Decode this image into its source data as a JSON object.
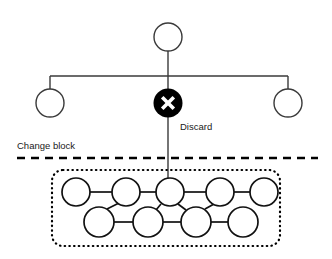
{
  "diagram": {
    "type": "tree-with-change-block",
    "canvas": {
      "width": 332,
      "height": 259,
      "background": "#ffffff"
    },
    "labels": {
      "discard": "Discard",
      "change_block": "Change block"
    },
    "colors": {
      "stroke": "#3a3a3a",
      "block_stroke": "#111111",
      "discard_fill": "#000000",
      "discard_mark": "#ffffff",
      "node_fill": "#ffffff",
      "divider": "#000000"
    },
    "nodes": {
      "root": {
        "cx": 168,
        "cy": 37,
        "r": 14,
        "fill": "#ffffff"
      },
      "branch_left": {
        "cx": 50,
        "cy": 103,
        "r": 14,
        "fill": "#ffffff"
      },
      "branch_right": {
        "cx": 288,
        "cy": 103,
        "r": 14,
        "fill": "#ffffff"
      },
      "discard": {
        "cx": 168,
        "cy": 103,
        "r": 14,
        "fill": "#000000",
        "mark": "x"
      }
    },
    "edges": {
      "root_stem": {
        "x1": 168,
        "y1": 51,
        "x2": 168,
        "y2": 89
      },
      "branch_bar": {
        "x1": 50,
        "y1": 76,
        "x2": 288,
        "y2": 76
      },
      "branch_left_drop": {
        "x1": 50,
        "y1": 76,
        "x2": 50,
        "y2": 89
      },
      "branch_right_drop": {
        "x1": 288,
        "y1": 76,
        "x2": 288,
        "y2": 89
      },
      "discard_to_block": {
        "x1": 168,
        "y1": 117,
        "x2": 168,
        "y2": 192
      }
    },
    "divider": {
      "label": "Change block",
      "y": 158,
      "x1": 17,
      "x2": 318
    },
    "change_block": {
      "outline": {
        "x": 52,
        "y": 170,
        "width": 228,
        "height": 76,
        "rx": 11
      },
      "top_row": {
        "count": 5,
        "cy": 192,
        "r": 14,
        "cx": [
          76,
          126,
          170,
          220,
          264
        ]
      },
      "bottom_row": {
        "count": 4,
        "cy": 222,
        "r": 15,
        "cx": [
          99,
          148,
          196,
          243
        ]
      },
      "connections": [
        "top-0 to top-1",
        "top-1 to top-2",
        "top-2 to top-3",
        "top-3 to top-4",
        "bottom-0 to bottom-1",
        "bottom-1 to bottom-2",
        "bottom-2 to bottom-3",
        "top-2 to bottom-1",
        "top-2 to bottom-2",
        "top-1 to bottom-0",
        "top-3 to bottom-2"
      ]
    }
  }
}
